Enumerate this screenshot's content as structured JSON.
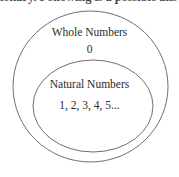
{
  "page": {
    "width": 179,
    "height": 177,
    "background": "#ffffff",
    "clipped_header_text": "ionary. Following is a possible ans"
  },
  "diagram": {
    "type": "nested-set-venn",
    "stroke_color": "#6f6f6f",
    "text_color": "#2b2b2b",
    "outer_set": {
      "label": "Whole Numbers",
      "members": "0"
    },
    "inner_set": {
      "label": "Natural Numbers",
      "members": "1, 2, 3, 4, 5..."
    }
  }
}
